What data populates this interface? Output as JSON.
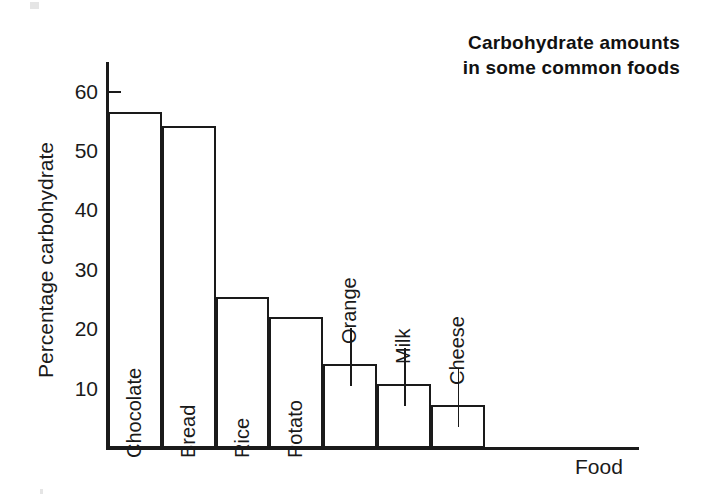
{
  "chart_data": {
    "type": "bar",
    "title": "Carbohydrate amounts in some common foods",
    "title_lines": [
      "Carbohydrate  amounts",
      "in some common foods"
    ],
    "xlabel": "Food",
    "ylabel": "Percentage carbohydrate",
    "categories": [
      "Chocolate",
      "Bread",
      "Rice",
      "Potato",
      "Orange",
      "Milk",
      "Cheese"
    ],
    "values": [
      56.5,
      54.2,
      25.5,
      22.0,
      14.2,
      10.7,
      7.2
    ],
    "ylim": [
      0,
      64
    ],
    "yticks": [
      10,
      20,
      30,
      40,
      50,
      60
    ],
    "ytick_labels": [
      "10",
      "20",
      "30",
      "40",
      "50",
      "60"
    ],
    "grid": false,
    "legend": false,
    "bar_fill": "#ffffff",
    "bar_stroke": "#1a1a1a",
    "label_placement": [
      "inside",
      "inside",
      "inside",
      "inside",
      "above",
      "above",
      "above"
    ]
  },
  "axes": {
    "y_title": "Percentage carbohydrate",
    "x_title": "Food"
  },
  "colors": {
    "ink": "#1a1a1a",
    "background": "#ffffff"
  }
}
